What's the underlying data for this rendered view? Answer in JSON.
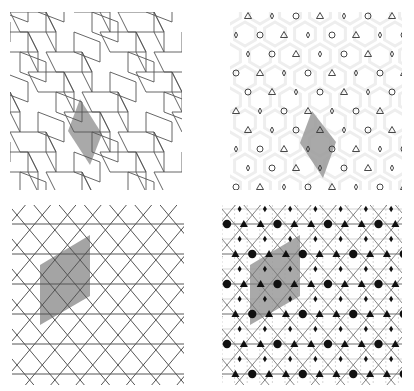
{
  "figure": {
    "width": 414,
    "height": 391,
    "background": "#ffffff",
    "colors": {
      "line": "#555555",
      "light_line": "#bbbbbb",
      "shade": "#9a9a9a",
      "shade_dark": "#888888",
      "motif": "#333333",
      "hex_faint": "#eeeeee"
    },
    "panels": [
      {
        "id": "top-left",
        "description": "Rhombic/parquet tiling with shaded fundamental cell",
        "x": 10,
        "y": 12,
        "w": 172,
        "h": 178,
        "shaded_cell": [
          [
            70,
            87
          ],
          [
            92,
            122
          ],
          [
            80,
            153
          ],
          [
            58,
            119
          ]
        ]
      },
      {
        "id": "top-right",
        "description": "Periodic motif pattern (circles, triangles, diamonds) on faint hexagonal lattice with shaded unit cell",
        "x": 230,
        "y": 12,
        "w": 172,
        "h": 178,
        "shaded_cell": [
          [
            82,
            99
          ],
          [
            106,
            130
          ],
          [
            93,
            166
          ],
          [
            70,
            131
          ]
        ],
        "motifs": [
          "circle",
          "triangle",
          "diamond"
        ]
      },
      {
        "id": "bottom-left",
        "description": "Hexagonal lattice of lines (triangular grid) with shaded rhombic unit cell",
        "x": 12,
        "y": 205,
        "w": 172,
        "h": 180,
        "shaded_cell": [
          [
            28,
            60
          ],
          [
            78,
            30
          ],
          [
            78,
            91
          ],
          [
            28,
            120
          ]
        ],
        "spacing_x": 50.5,
        "spacing_y": 30
      },
      {
        "id": "bottom-right",
        "description": "Symmetry-element diagram: 6-fold (large dots), 3-fold (triangles), 2-fold (small diamonds) rotation centres with mirror and glide lines; shaded unit cell",
        "x": 222,
        "y": 205,
        "w": 180,
        "h": 180,
        "shaded_cell": [
          [
            28,
            60
          ],
          [
            78,
            30
          ],
          [
            78,
            91
          ],
          [
            28,
            120
          ]
        ],
        "spacing_x": 50.5,
        "spacing_y": 30
      }
    ]
  }
}
